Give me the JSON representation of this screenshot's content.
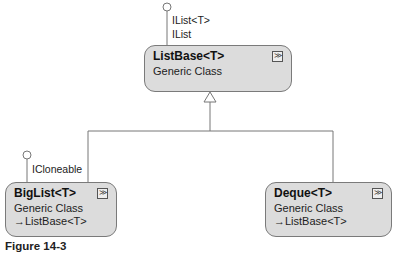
{
  "classes": {
    "listbase": {
      "name": "ListBase<T>",
      "kind": "Generic Class",
      "interfaces": [
        "IList<T>",
        "IList"
      ]
    },
    "biglist": {
      "name": "BigList<T>",
      "kind": "Generic Class",
      "inherits": "ListBase<T>",
      "interfaces": [
        "ICloneable"
      ]
    },
    "deque": {
      "name": "Deque<T>",
      "kind": "Generic Class",
      "inherits": "ListBase<T>"
    }
  },
  "icons": {
    "expand": "double-chevron-down-icon",
    "inheritance": "arrow-right-triangle-icon",
    "interface": "lollipop-icon"
  },
  "colors": {
    "box_fill": "#dcdcdc",
    "box_border": "#7a7a7a",
    "line": "#777777"
  },
  "caption": "Figure 14-3"
}
